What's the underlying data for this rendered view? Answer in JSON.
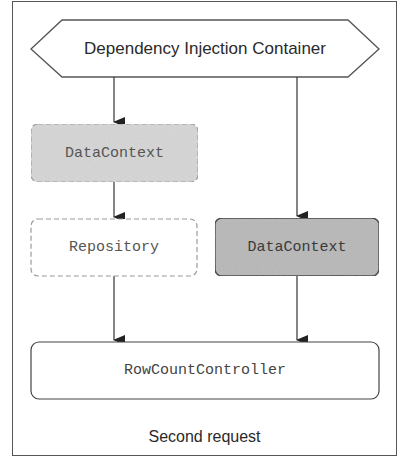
{
  "diagram": {
    "caption": "Second request",
    "container": {
      "label": "Dependency Injection Container",
      "shape": "hexagon"
    },
    "nodes": [
      {
        "id": "datacontext_stale",
        "label": "DataContext",
        "style": "dashed",
        "fill": "#d6d6d6"
      },
      {
        "id": "repository",
        "label": "Repository",
        "style": "dashed",
        "fill": "#ffffff"
      },
      {
        "id": "datacontext_new",
        "label": "DataContext",
        "style": "solid",
        "fill": "#b8b8b8"
      },
      {
        "id": "rowcountcontroller",
        "label": "RowCountController",
        "style": "solid",
        "fill": "#ffffff"
      }
    ],
    "edges": [
      {
        "from": "container",
        "to": "datacontext_stale"
      },
      {
        "from": "datacontext_stale",
        "to": "repository"
      },
      {
        "from": "container",
        "to": "datacontext_new"
      },
      {
        "from": "repository",
        "to": "rowcountcontroller"
      },
      {
        "from": "datacontext_new",
        "to": "rowcountcontroller"
      }
    ],
    "colors": {
      "stroke": "#444444",
      "dashed_stroke": "#9a9a9a",
      "stale_fill": "#d6d6d6",
      "active_fill": "#b8b8b8"
    }
  }
}
